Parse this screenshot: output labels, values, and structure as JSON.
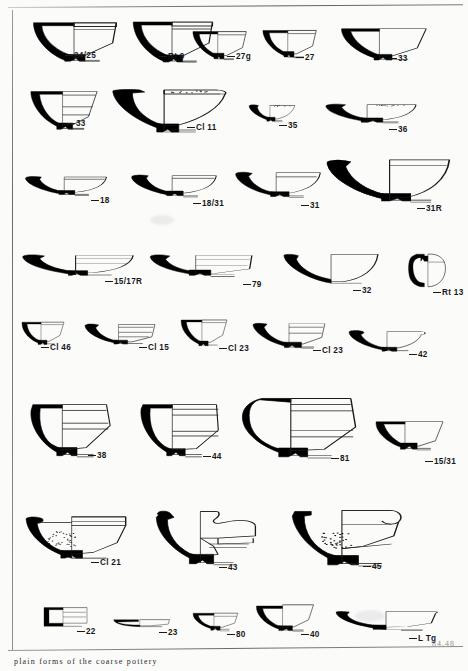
{
  "plate": {
    "title": "Roman pottery plate of vessel profile drawings",
    "archive_mark": "84.48",
    "caption": "plain forms of the coarse pottery",
    "drawing_convention": {
      "section_fill": "#000000",
      "outline_stroke": "#1a1a1a",
      "paper": "#fbfbfa"
    }
  },
  "rows": [
    {
      "id": "row-1",
      "figures": [
        {
          "label": "24/25",
          "form": "conical-bowl-footring",
          "x": 28,
          "y": 18,
          "w": 92,
          "h": 48,
          "label_x": 74,
          "label_y": 52
        },
        {
          "label": "Rt 9",
          "form": "conical-bowl-footring",
          "x": 128,
          "y": 17,
          "w": 88,
          "h": 50,
          "label_x": 168,
          "label_y": 53
        },
        {
          "label": "27g",
          "form": "hemispherical-cup",
          "x": 188,
          "y": 26,
          "w": 62,
          "h": 40,
          "label_x": 236,
          "label_y": 53
        },
        {
          "label": "27",
          "form": "hemispherical-cup",
          "x": 258,
          "y": 25,
          "w": 62,
          "h": 39,
          "label_x": 305,
          "label_y": 54
        },
        {
          "label": "33",
          "form": "flared-bowl",
          "x": 338,
          "y": 24,
          "w": 90,
          "h": 40,
          "label_x": 398,
          "label_y": 55
        }
      ]
    },
    {
      "id": "row-2",
      "figures": [
        {
          "label": "33",
          "form": "deep-flared-bowl",
          "x": 28,
          "y": 87,
          "w": 72,
          "h": 45,
          "label_x": 76,
          "label_y": 120
        },
        {
          "label": "Cl 11",
          "form": "flanged-mortarium",
          "x": 108,
          "y": 86,
          "w": 122,
          "h": 50,
          "label_x": 196,
          "label_y": 124
        },
        {
          "label": "35",
          "form": "shallow-dish-small",
          "x": 246,
          "y": 101,
          "w": 52,
          "h": 28,
          "label_x": 288,
          "label_y": 122
        },
        {
          "label": "36",
          "form": "shallow-dish-wide",
          "x": 322,
          "y": 100,
          "w": 98,
          "h": 30,
          "label_x": 398,
          "label_y": 126
        }
      ]
    },
    {
      "id": "row-3",
      "figures": [
        {
          "label": "18",
          "form": "shallow-platter",
          "x": 22,
          "y": 172,
          "w": 88,
          "h": 28,
          "label_x": 100,
          "label_y": 197
        },
        {
          "label": "18/31",
          "form": "shallow-platter",
          "x": 128,
          "y": 170,
          "w": 92,
          "h": 32,
          "label_x": 202,
          "label_y": 200
        },
        {
          "label": "31",
          "form": "dish-curved",
          "x": 232,
          "y": 168,
          "w": 92,
          "h": 34,
          "label_x": 310,
          "label_y": 202
        },
        {
          "label": "31R",
          "form": "large-dish-rouletted",
          "x": 322,
          "y": 156,
          "w": 130,
          "h": 48,
          "label_x": 426,
          "label_y": 205
        }
      ]
    },
    {
      "id": "row-4",
      "figures": [
        {
          "label": "15/17R",
          "form": "platter-stepped",
          "x": 18,
          "y": 249,
          "w": 120,
          "h": 32,
          "label_x": 114,
          "label_y": 278
        },
        {
          "label": "79",
          "form": "wide-platter",
          "x": 146,
          "y": 249,
          "w": 108,
          "h": 32,
          "label_x": 252,
          "label_y": 281
        },
        {
          "label": "32",
          "form": "deep-dish-plain",
          "x": 278,
          "y": 250,
          "w": 102,
          "h": 36,
          "label_x": 362,
          "label_y": 287
        },
        {
          "label": "Rt 13",
          "form": "squat-jar",
          "x": 405,
          "y": 248,
          "w": 44,
          "h": 44,
          "label_x": 442,
          "label_y": 289
        }
      ]
    },
    {
      "id": "row-5",
      "figures": [
        {
          "label": "Cl 46",
          "form": "small-cup-footring",
          "x": 18,
          "y": 318,
          "w": 50,
          "h": 30,
          "label_x": 50,
          "label_y": 344
        },
        {
          "label": "Cl 15",
          "form": "dish-with-rim",
          "x": 82,
          "y": 320,
          "w": 76,
          "h": 28,
          "label_x": 148,
          "label_y": 344
        },
        {
          "label": "Cl 23",
          "form": "cup-flared-footring",
          "x": 178,
          "y": 316,
          "w": 52,
          "h": 33,
          "label_x": 228,
          "label_y": 345
        },
        {
          "label": "Cl 23",
          "form": "bowl-flanged-small",
          "x": 250,
          "y": 320,
          "w": 78,
          "h": 30,
          "label_x": 322,
          "label_y": 347
        },
        {
          "label": "42",
          "form": "shallow-bowl-beaded",
          "x": 346,
          "y": 326,
          "w": 82,
          "h": 28,
          "label_x": 418,
          "label_y": 351
        }
      ]
    },
    {
      "id": "row-6",
      "figures": [
        {
          "label": "38",
          "form": "deep-bowl-curved",
          "x": 20,
          "y": 400,
          "w": 92,
          "h": 58,
          "label_x": 97,
          "label_y": 452
        },
        {
          "label": "44",
          "form": "deep-bowl-straight",
          "x": 130,
          "y": 400,
          "w": 92,
          "h": 58,
          "label_x": 212,
          "label_y": 453
        },
        {
          "label": "81",
          "form": "large-deep-bowl",
          "x": 238,
          "y": 396,
          "w": 120,
          "h": 62,
          "label_x": 340,
          "label_y": 455
        },
        {
          "label": "15/31",
          "form": "small-cup-conical",
          "x": 370,
          "y": 418,
          "w": 76,
          "h": 38,
          "label_x": 434,
          "label_y": 458
        }
      ]
    },
    {
      "id": "row-7",
      "figures": [
        {
          "label": "Cl 21",
          "form": "mortarium-gritted",
          "x": 22,
          "y": 513,
          "w": 108,
          "h": 48,
          "label_x": 100,
          "label_y": 559
        },
        {
          "label": "43",
          "form": "mortarium-flanged",
          "x": 152,
          "y": 508,
          "w": 110,
          "h": 58,
          "label_x": 228,
          "label_y": 564
        },
        {
          "label": "45",
          "form": "mortarium-large",
          "x": 290,
          "y": 508,
          "w": 118,
          "h": 58,
          "label_x": 372,
          "label_y": 563
        }
      ]
    },
    {
      "id": "row-8",
      "figures": [
        {
          "label": "22",
          "form": "small-box-vessel",
          "x": 40,
          "y": 605,
          "w": 50,
          "h": 26,
          "label_x": 86,
          "label_y": 628
        },
        {
          "label": "23",
          "form": "very-shallow-dish",
          "x": 110,
          "y": 616,
          "w": 62,
          "h": 14,
          "label_x": 168,
          "label_y": 629
        },
        {
          "label": "80",
          "form": "small-footed-bowl",
          "x": 190,
          "y": 608,
          "w": 52,
          "h": 26,
          "label_x": 236,
          "label_y": 631
        },
        {
          "label": "40",
          "form": "flared-cup",
          "x": 254,
          "y": 603,
          "w": 62,
          "h": 30,
          "label_x": 310,
          "label_y": 631
        },
        {
          "label": "L Tg",
          "form": "wide-shallow-platter",
          "x": 332,
          "y": 609,
          "w": 108,
          "h": 26,
          "label_x": 418,
          "label_y": 635
        }
      ]
    }
  ]
}
